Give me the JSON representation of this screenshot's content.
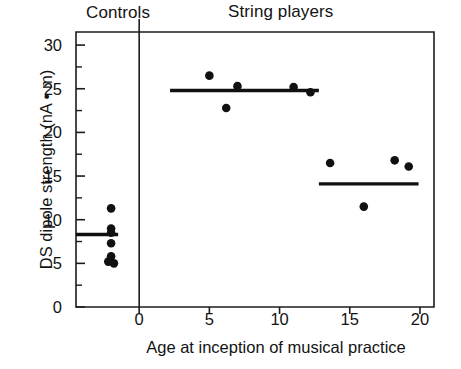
{
  "figure": {
    "group_headings": [
      {
        "name": "controls",
        "label": "Controls"
      },
      {
        "name": "string-players",
        "label": "String players"
      }
    ]
  },
  "chart_data": {
    "type": "scatter",
    "title": "",
    "xlabel": "Age at inception of musical practice",
    "ylabel": "DS dipole strength (nA • m)",
    "xlim": [
      -4.5,
      21
    ],
    "ylim": [
      0,
      31.5
    ],
    "xticks": [
      0,
      5,
      10,
      15,
      20
    ],
    "xtick_labels": [
      "0",
      "5",
      "10",
      "15",
      "20"
    ],
    "yticks": [
      0,
      5,
      10,
      15,
      20,
      25,
      30
    ],
    "ytick_labels": [
      "0",
      "5",
      "10",
      "15",
      "20",
      "25",
      "30"
    ],
    "yminor_ticks": [
      2.5,
      7.5,
      12.5,
      17.5,
      22.5,
      27.5
    ],
    "grid": false,
    "legend": "none",
    "divider_x": 0,
    "series": [
      {
        "name": "Controls",
        "marker": "filled-circle",
        "color": "#111111",
        "points": [
          {
            "x": -2.0,
            "y": 11.3
          },
          {
            "x": -2.0,
            "y": 9.0
          },
          {
            "x": -2.0,
            "y": 8.5
          },
          {
            "x": -2.0,
            "y": 7.3
          },
          {
            "x": -2.0,
            "y": 5.8
          },
          {
            "x": -2.2,
            "y": 5.2
          },
          {
            "x": -1.8,
            "y": 5.0
          }
        ],
        "mean_line": {
          "value": 8.3,
          "x_start": -4.5,
          "x_end": -1.5
        }
      },
      {
        "name": "String players (early onset)",
        "marker": "filled-circle",
        "color": "#111111",
        "points": [
          {
            "x": 5.0,
            "y": 26.5
          },
          {
            "x": 6.2,
            "y": 22.8
          },
          {
            "x": 7.0,
            "y": 25.3
          },
          {
            "x": 11.0,
            "y": 25.2
          },
          {
            "x": 12.2,
            "y": 24.6
          }
        ],
        "mean_line": {
          "value": 24.8,
          "x_start": 2.2,
          "x_end": 12.8
        }
      },
      {
        "name": "String players (late onset)",
        "marker": "filled-circle",
        "color": "#111111",
        "points": [
          {
            "x": 13.6,
            "y": 16.5
          },
          {
            "x": 16.0,
            "y": 11.5
          },
          {
            "x": 18.2,
            "y": 16.8
          },
          {
            "x": 19.2,
            "y": 16.1
          }
        ],
        "mean_line": {
          "value": 14.1,
          "x_start": 12.8,
          "x_end": 19.9
        }
      }
    ]
  }
}
